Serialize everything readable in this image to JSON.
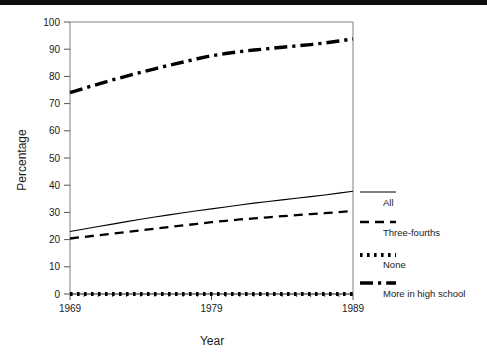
{
  "figure": {
    "top_rule_color": "#0d0d0d",
    "background": "#ffffff",
    "ink_color": "#000000",
    "axis_color": "#808080"
  },
  "axes": {
    "y_title": "Percentage",
    "x_title": "Year",
    "y_ticks": [
      "0",
      "10",
      "20",
      "30",
      "40",
      "50",
      "60",
      "70",
      "80",
      "90",
      "100"
    ],
    "x_ticks": [
      "1969",
      "1979",
      "1989"
    ]
  },
  "legend": {
    "entries": [
      {
        "label": "All",
        "style": "solid-thin"
      },
      {
        "label": "Three-fourths",
        "style": "dashed"
      },
      {
        "label": "None",
        "style": "dotted-thick"
      },
      {
        "label": "More in high school",
        "style": "dashdot-thick"
      }
    ]
  },
  "chart_data": {
    "type": "line",
    "title": "",
    "xlabel": "Year",
    "ylabel": "Percentage",
    "xlim": [
      1969,
      1989
    ],
    "ylim": [
      0,
      100
    ],
    "grid": false,
    "legend_position": "right",
    "x": [
      1969,
      1970,
      1971,
      1972,
      1973,
      1974,
      1975,
      1976,
      1977,
      1978,
      1979,
      1980,
      1981,
      1982,
      1983,
      1984,
      1985,
      1986,
      1987,
      1988,
      1989
    ],
    "series": [
      {
        "name": "More in high school",
        "style": "dashdot-thick",
        "values": [
          74.0,
          75.6,
          77.2,
          78.7,
          80.1,
          81.5,
          82.8,
          84.1,
          85.3,
          86.5,
          87.6,
          88.4,
          89.1,
          89.7,
          90.2,
          90.7,
          91.2,
          91.7,
          92.3,
          93.0,
          93.8
        ]
      },
      {
        "name": "All",
        "style": "solid-thin",
        "values": [
          23.0,
          23.9,
          24.8,
          25.7,
          26.6,
          27.5,
          28.3,
          29.1,
          29.9,
          30.6,
          31.3,
          32.0,
          32.7,
          33.4,
          34.0,
          34.6,
          35.2,
          35.8,
          36.4,
          37.1,
          37.8
        ]
      },
      {
        "name": "Three-fourths",
        "style": "dashed",
        "values": [
          20.4,
          21.0,
          21.6,
          22.2,
          22.8,
          23.4,
          24.0,
          24.6,
          25.2,
          25.8,
          26.4,
          26.9,
          27.4,
          27.8,
          28.2,
          28.6,
          29.0,
          29.4,
          29.7,
          30.1,
          30.5
        ]
      },
      {
        "name": "None",
        "style": "dotted-thick",
        "values": [
          0,
          0,
          0,
          0,
          0,
          0,
          0,
          0,
          0,
          0,
          0,
          0,
          0,
          0,
          0,
          0,
          0,
          0,
          0,
          0,
          0
        ]
      }
    ]
  }
}
